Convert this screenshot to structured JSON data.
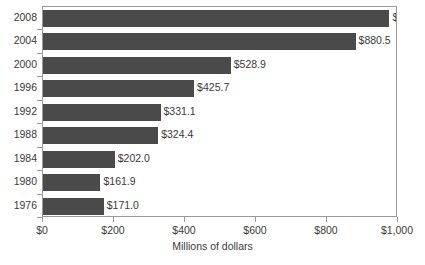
{
  "chart_data": {
    "type": "bar",
    "orientation": "horizontal",
    "title": "",
    "xlabel": "Millions of dollars",
    "ylabel": "",
    "xlim": [
      0,
      1000
    ],
    "grid": false,
    "legend": false,
    "categories": [
      "2008",
      "2004",
      "2000",
      "1996",
      "1992",
      "1988",
      "1984",
      "1980",
      "1976"
    ],
    "values": [
      975.9,
      880.5,
      528.9,
      425.7,
      331.1,
      324.4,
      202.0,
      161.9,
      171.0
    ],
    "data_labels": [
      "$975.9",
      "$880.5",
      "$528.9",
      "$425.7",
      "$331.1",
      "$324.4",
      "$202.0",
      "$161.9",
      "$171.0"
    ],
    "xticks": [
      0,
      200,
      400,
      600,
      800,
      1000
    ],
    "xtick_labels": [
      "$0",
      "$200",
      "$400",
      "$600",
      "$800",
      "$1,000"
    ],
    "bar_color": "#4a4a4a",
    "background_color": "#ffffff",
    "axis_color": "#9a9a9a"
  }
}
